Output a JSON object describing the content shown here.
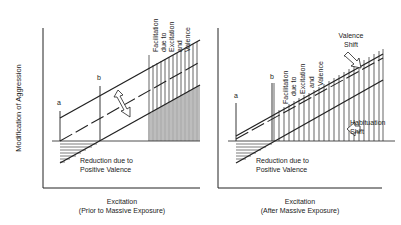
{
  "ylabel": "Modification of Aggression",
  "left": {
    "xlabel1": "Excitation",
    "xlabel2": "(Prior to Massive Exposure)",
    "label_a": "a",
    "label_b": "b",
    "facilitation": [
      "Facilitation",
      "due to",
      "Excitation",
      "and",
      "Valence"
    ],
    "reduction": [
      "Reduction due to",
      "Positive Valence"
    ]
  },
  "right": {
    "xlabel1": "Excitation",
    "xlabel2": "(After Massive Exposure)",
    "label_a": "a",
    "label_b": "b",
    "facilitation": [
      "Facilitation",
      "due to",
      "Excitation",
      "and",
      "Valence"
    ],
    "reduction": [
      "Reduction due to",
      "Positive Valence"
    ],
    "valence_shift": [
      "Valence",
      "Shift"
    ],
    "habituation_shift": [
      "Habituation",
      "Shift"
    ]
  }
}
